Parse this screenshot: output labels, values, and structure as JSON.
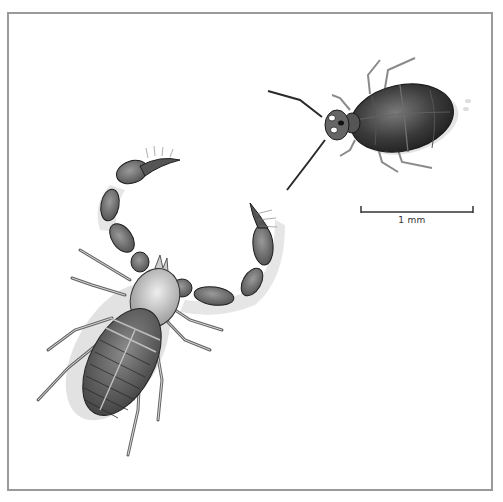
{
  "figure": {
    "subjects": [
      {
        "name": "pseudoscorpion",
        "position": "lower-left"
      },
      {
        "name": "small-insect",
        "position": "upper-right"
      }
    ],
    "scale_bar": {
      "label": "1 mm",
      "length_px": 113
    },
    "colors": {
      "frame": "#9a9a9a",
      "ink": "#2a2a2a",
      "shadow": "#d8d8d8",
      "background": "#ffffff"
    }
  }
}
